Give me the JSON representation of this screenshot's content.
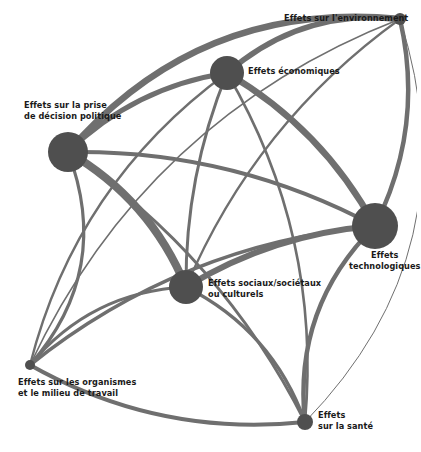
{
  "diagram": {
    "type": "network-graph",
    "title": "",
    "background_color": "#ffffff",
    "node_color": "#4f4f4f",
    "edge_color": "#6f6f6f",
    "label_color": "#1a1a1a",
    "nodes": [
      {
        "id": "environnement",
        "label": "Effets sur l'environnement",
        "label_lines": [
          "Effets sur l'environnement"
        ],
        "x": 400,
        "y": 19,
        "radius": 6,
        "size_rank": 6,
        "label_x": 284,
        "label_y": 13,
        "label_align": "left"
      },
      {
        "id": "economiques",
        "label": "Effets économiques",
        "label_lines": [
          "Effets économiques"
        ],
        "x": 227,
        "y": 73,
        "radius": 17,
        "size_rank": 3,
        "label_x": 248,
        "label_y": 66,
        "label_align": "left"
      },
      {
        "id": "politique",
        "label": "Effets sur la prise de décision politique",
        "label_lines": [
          "Effets sur la prise",
          "de décision politique"
        ],
        "x": 68,
        "y": 152,
        "radius": 20,
        "size_rank": 2,
        "label_x": 24,
        "label_y": 100,
        "label_align": "left"
      },
      {
        "id": "technologiques",
        "label": "Effets technologiques",
        "label_lines": [
          "Effets",
          "technologiques"
        ],
        "x": 375,
        "y": 226,
        "radius": 23,
        "size_rank": 1,
        "label_x": 349,
        "label_y": 250,
        "label_align": "center"
      },
      {
        "id": "sociaux",
        "label": "Effets sociaux/sociétaux ou culturels",
        "label_lines": [
          "Effets sociaux/sociétaux",
          "ou culturels"
        ],
        "x": 186,
        "y": 287,
        "radius": 17,
        "size_rank": 4,
        "label_x": 208,
        "label_y": 278,
        "label_align": "left"
      },
      {
        "id": "organismes",
        "label": "Effets sur les organismes et le milieu de travail",
        "label_lines": [
          "Effets sur les organismes",
          "et le milieu de travail"
        ],
        "x": 30,
        "y": 365,
        "radius": 5,
        "size_rank": 7,
        "label_x": 18,
        "label_y": 377,
        "label_align": "left"
      },
      {
        "id": "sante",
        "label": "Effets sur la santé",
        "label_lines": [
          "Effets",
          "sur la santé"
        ],
        "x": 305,
        "y": 422,
        "radius": 8,
        "size_rank": 5,
        "label_x": 318,
        "label_y": 410,
        "label_align": "left"
      }
    ],
    "edges": [
      {
        "source": "environnement",
        "target": "economiques",
        "width": 5.5,
        "curve": 0.22
      },
      {
        "source": "environnement",
        "target": "politique",
        "width": 6.5,
        "curve": 0.26
      },
      {
        "source": "environnement",
        "target": "technologiques",
        "width": 4.5,
        "curve": -0.18
      },
      {
        "source": "environnement",
        "target": "sociaux",
        "width": 2.2,
        "curve": 0.14
      },
      {
        "source": "environnement",
        "target": "organismes",
        "width": 1.6,
        "curve": 0.2
      },
      {
        "source": "environnement",
        "target": "sante",
        "width": 1.0,
        "curve": -0.3
      },
      {
        "source": "economiques",
        "target": "politique",
        "width": 5.0,
        "curve": 0.16
      },
      {
        "source": "economiques",
        "target": "technologiques",
        "width": 6.5,
        "curve": -0.14
      },
      {
        "source": "economiques",
        "target": "sociaux",
        "width": 3.0,
        "curve": 0.1
      },
      {
        "source": "economiques",
        "target": "organismes",
        "width": 2.4,
        "curve": 0.18
      },
      {
        "source": "economiques",
        "target": "sante",
        "width": 2.6,
        "curve": -0.16
      },
      {
        "source": "politique",
        "target": "technologiques",
        "width": 4.0,
        "curve": -0.13
      },
      {
        "source": "politique",
        "target": "sociaux",
        "width": 8.0,
        "curve": -0.17
      },
      {
        "source": "politique",
        "target": "organismes",
        "width": 3.2,
        "curve": -0.3
      },
      {
        "source": "politique",
        "target": "sante",
        "width": 2.8,
        "curve": -0.13
      },
      {
        "source": "technologiques",
        "target": "sociaux",
        "width": 6.0,
        "curve": 0.12
      },
      {
        "source": "technologiques",
        "target": "organismes",
        "width": 3.6,
        "curve": 0.15
      },
      {
        "source": "technologiques",
        "target": "sante",
        "width": 4.5,
        "curve": 0.24
      },
      {
        "source": "sociaux",
        "target": "organismes",
        "width": 3.0,
        "curve": 0.22
      },
      {
        "source": "sociaux",
        "target": "sante",
        "width": 3.4,
        "curve": -0.2
      },
      {
        "source": "organismes",
        "target": "sante",
        "width": 4.2,
        "curve": 0.16
      }
    ]
  }
}
